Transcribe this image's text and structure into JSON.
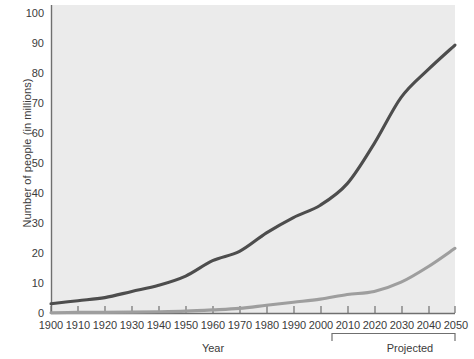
{
  "chart_data": {
    "type": "line",
    "title": "",
    "xlabel": "Year",
    "ylabel": "Number of people (in millions)",
    "xlim": [
      1900,
      2050
    ],
    "ylim": [
      0,
      100
    ],
    "grid": false,
    "legend_position": "inline-annotation",
    "x": [
      1900,
      1910,
      1920,
      1930,
      1940,
      1950,
      1960,
      1970,
      1980,
      1990,
      2000,
      2010,
      2020,
      2030,
      2040,
      2050
    ],
    "xticks": [
      "1900",
      "1910",
      "1920",
      "1930",
      "1940",
      "1950",
      "1960",
      "1970",
      "1980",
      "1990",
      "2000",
      "2010",
      "2020",
      "2030",
      "2040",
      "2050"
    ],
    "yticks": [
      "0",
      "10",
      "20",
      "30",
      "40",
      "50",
      "60",
      "70",
      "80",
      "90",
      "100"
    ],
    "series": [
      {
        "name": "65 and older",
        "color": "#4d4d4d",
        "values": [
          3,
          4,
          5,
          7,
          9,
          12,
          17,
          20,
          26,
          31,
          35,
          42,
          55,
          70,
          79,
          87
        ]
      },
      {
        "name": "85 and older",
        "color": "#9e9e9e",
        "values": [
          0.1,
          0.2,
          0.2,
          0.3,
          0.4,
          0.6,
          1,
          1.5,
          2.5,
          3.5,
          4.5,
          6,
          7,
          10,
          15,
          21
        ]
      }
    ],
    "annotations": [
      {
        "text": "65 and older",
        "x": 1980,
        "y": 30
      },
      {
        "text": "85 and older",
        "x": 2023,
        "y": 19
      },
      {
        "text": "Projected",
        "x": 2031,
        "y": -12
      }
    ],
    "bracket": {
      "label": "Projected",
      "from": 2010,
      "to": 2050
    }
  }
}
